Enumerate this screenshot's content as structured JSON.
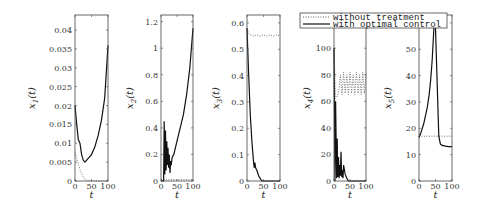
{
  "chart_data": [
    {
      "type": "line",
      "panel": 1,
      "ylabel": "x_1(t)",
      "ylabel_main": "x",
      "ylabel_sub": "1",
      "xlabel": "t",
      "xlim": [
        0,
        100
      ],
      "ylim": [
        0,
        0.044
      ],
      "xticks": [
        0,
        50,
        100
      ],
      "xtick_labels": [
        "0",
        "50",
        "100"
      ],
      "yticks": [
        0,
        0.005,
        0.01,
        0.015,
        0.02,
        0.025,
        0.03,
        0.035,
        0.04
      ],
      "ytick_labels": [
        "0",
        "0.005",
        "0.01",
        "0.015",
        "0.02",
        "0.025",
        "0.03",
        "0.035",
        "0.04"
      ],
      "series": [
        {
          "name": "without treatment",
          "style": "dotted",
          "x": [
            0,
            5,
            10,
            15,
            20,
            25,
            30,
            35,
            40,
            50,
            100
          ],
          "y": [
            0.0075,
            0.006,
            0.0045,
            0.003,
            0.002,
            0.001,
            0.0005,
            0.0002,
            0.0001,
            0.0,
            0.0
          ]
        },
        {
          "name": "with optimal control",
          "style": "solid",
          "x": [
            0,
            5,
            10,
            15,
            20,
            25,
            30,
            40,
            50,
            60,
            70,
            80,
            90,
            100
          ],
          "y": [
            0.02,
            0.015,
            0.011,
            0.01,
            0.007,
            0.0055,
            0.005,
            0.006,
            0.007,
            0.009,
            0.012,
            0.016,
            0.022,
            0.036
          ]
        }
      ]
    },
    {
      "type": "line",
      "panel": 2,
      "ylabel": "x_2(t)",
      "ylabel_main": "x",
      "ylabel_sub": "2",
      "xlabel": "t",
      "xlim": [
        0,
        100
      ],
      "ylim": [
        0,
        1.25
      ],
      "xticks": [
        0,
        50,
        100
      ],
      "xtick_labels": [
        "0",
        "50",
        "100"
      ],
      "yticks": [
        0,
        0.2,
        0.4,
        0.6,
        0.8,
        1,
        1.2
      ],
      "ytick_labels": [
        "0",
        "0.2",
        "0.4",
        "0.6",
        "0.8",
        "1",
        "1.2"
      ],
      "series": [
        {
          "name": "without treatment",
          "style": "dotted",
          "x": [
            0,
            100
          ],
          "y": [
            0.01,
            0.01
          ]
        },
        {
          "name": "with optimal control",
          "style": "solid",
          "x": [
            0,
            8,
            10,
            12,
            14,
            16,
            18,
            20,
            22,
            24,
            26,
            28,
            30,
            32,
            35,
            40,
            50,
            60,
            70,
            80,
            90,
            100
          ],
          "y": [
            0.0,
            0.0,
            0.45,
            0.05,
            0.38,
            0.08,
            0.3,
            0.12,
            0.25,
            0.1,
            0.2,
            0.06,
            0.15,
            0.12,
            0.18,
            0.2,
            0.3,
            0.4,
            0.5,
            0.65,
            0.85,
            1.15
          ]
        }
      ]
    },
    {
      "type": "line",
      "panel": 3,
      "ylabel": "x_3(t)",
      "ylabel_main": "x",
      "ylabel_sub": "3",
      "xlabel": "t",
      "xlim": [
        0,
        100
      ],
      "ylim": [
        0,
        0.63
      ],
      "xticks": [
        0,
        50,
        100
      ],
      "xtick_labels": [
        "0",
        "50",
        "100"
      ],
      "yticks": [
        0,
        0.1,
        0.2,
        0.3,
        0.4,
        0.5,
        0.6
      ],
      "ytick_labels": [
        "0",
        "0.1",
        "0.2",
        "0.3",
        "0.4",
        "0.5",
        "0.6"
      ],
      "series": [
        {
          "name": "without treatment",
          "style": "dotted",
          "x": [
            0,
            5,
            10,
            20,
            30,
            40,
            50,
            60,
            70,
            80,
            90,
            100
          ],
          "y": [
            0.58,
            0.56,
            0.555,
            0.55,
            0.555,
            0.55,
            0.555,
            0.55,
            0.555,
            0.55,
            0.555,
            0.55
          ]
        },
        {
          "name": "with optimal control",
          "style": "solid",
          "x": [
            0,
            5,
            10,
            15,
            20,
            22,
            24,
            26,
            30,
            35,
            40,
            45,
            50,
            100
          ],
          "y": [
            0.58,
            0.4,
            0.25,
            0.15,
            0.07,
            0.05,
            0.07,
            0.05,
            0.04,
            0.02,
            0.01,
            0.0,
            0.0,
            0.0
          ]
        }
      ]
    },
    {
      "type": "line",
      "panel": 4,
      "ylabel": "x_4(t)",
      "ylabel_main": "x",
      "ylabel_sub": "4",
      "xlabel": "t",
      "xlim": [
        0,
        100
      ],
      "ylim": [
        0,
        125
      ],
      "xticks": [
        0,
        50,
        100
      ],
      "xtick_labels": [
        "0",
        "50",
        "100"
      ],
      "yticks": [
        0,
        20,
        40,
        60,
        80,
        100,
        120
      ],
      "ytick_labels": [
        "0",
        "20",
        "40",
        "60",
        "80",
        "100",
        "120"
      ],
      "series": [
        {
          "name": "without treatment",
          "style": "dotted",
          "x": [
            0,
            5,
            10,
            15,
            20,
            25,
            30,
            35,
            40,
            45,
            50,
            55,
            60,
            65,
            70,
            75,
            80,
            85,
            90,
            95,
            100
          ],
          "y": [
            100,
            62,
            64,
            68,
            80,
            65,
            82,
            66,
            80,
            65,
            82,
            66,
            80,
            65,
            82,
            66,
            80,
            65,
            82,
            66,
            80
          ]
        },
        {
          "name": "with optimal control",
          "style": "solid",
          "x": [
            0,
            3,
            5,
            8,
            10,
            12,
            14,
            16,
            18,
            20,
            22,
            24,
            26,
            28,
            30,
            35,
            40,
            45,
            50,
            100
          ],
          "y": [
            100,
            0,
            60,
            2,
            32,
            3,
            18,
            2,
            12,
            4,
            22,
            3,
            8,
            2,
            12,
            5,
            2,
            0,
            0,
            0
          ]
        }
      ]
    },
    {
      "type": "line",
      "panel": 5,
      "ylabel": "x_5(t)",
      "ylabel_main": "x",
      "ylabel_sub": "5",
      "xlabel": "t",
      "xlim": [
        0,
        100
      ],
      "ylim": [
        0,
        63
      ],
      "xticks": [
        0,
        50,
        100
      ],
      "xtick_labels": [
        "0",
        "50",
        "100"
      ],
      "yticks": [
        0,
        10,
        20,
        30,
        40,
        50,
        60
      ],
      "ytick_labels": [
        "0",
        "10",
        "20",
        "30",
        "40",
        "50",
        "60"
      ],
      "series": [
        {
          "name": "without treatment",
          "style": "dotted",
          "x": [
            0,
            100
          ],
          "y": [
            17,
            17
          ]
        },
        {
          "name": "with optimal control",
          "style": "solid",
          "x": [
            0,
            5,
            10,
            15,
            20,
            25,
            30,
            35,
            40,
            45,
            48,
            50,
            55,
            60,
            65,
            70,
            80,
            90,
            100
          ],
          "y": [
            16.5,
            18,
            20,
            22,
            25,
            28,
            32,
            38,
            46,
            58,
            63,
            58,
            38,
            17,
            14,
            13.5,
            13.2,
            13,
            13
          ]
        }
      ]
    }
  ],
  "legend": {
    "entries": [
      {
        "label": "without treatment",
        "style": "dotted"
      },
      {
        "label": "with optimal control",
        "style": "solid"
      }
    ]
  },
  "colors": {
    "line": "#111111",
    "dotted": "#666666",
    "axes": "#444444"
  }
}
